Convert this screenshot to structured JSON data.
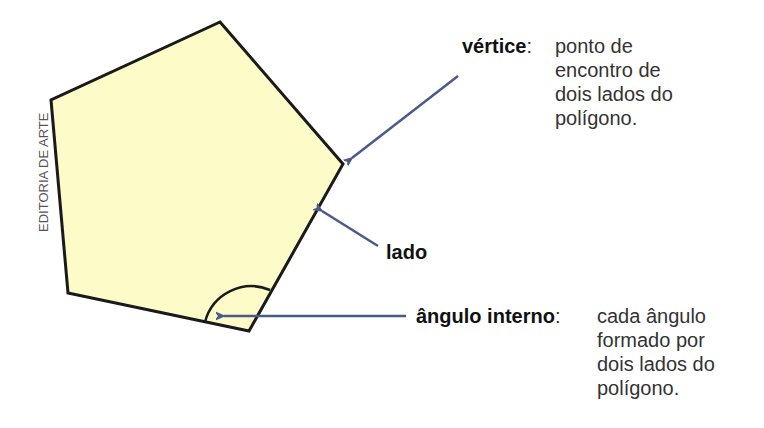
{
  "credit": "EDITORIA DE ARTE",
  "colors": {
    "fill": "#fdfbc8",
    "stroke": "#1a1a1a",
    "arrow": "#4a5a8a"
  },
  "labels": {
    "vertex": {
      "term": "vértice",
      "sep": ":",
      "lines": [
        "ponto de",
        "encontro de",
        "dois lados do",
        "polígono."
      ]
    },
    "side": {
      "term": "lado"
    },
    "angle": {
      "term": "ângulo interno",
      "sep": ":",
      "lines": [
        "cada ângulo",
        "formado por",
        "dois lados do",
        "polígono."
      ]
    }
  }
}
